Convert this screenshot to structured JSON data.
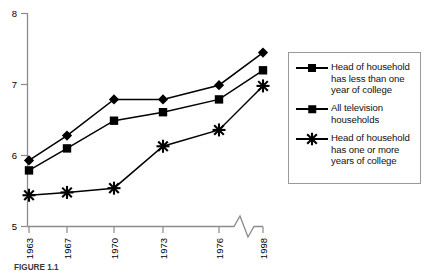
{
  "chart_data": {
    "type": "line",
    "title": "",
    "subtitle": "",
    "xlabel": "",
    "ylabel": "",
    "categories": [
      "1963",
      "1967",
      "1970",
      "1973",
      "1976",
      "1998"
    ],
    "x_tick_labels": [
      "1963",
      "1967",
      "1970",
      "1973",
      "1976",
      "1998"
    ],
    "y_tick_labels": [
      "5",
      "6",
      "7",
      "8"
    ],
    "ylim": [
      5,
      8
    ],
    "y_ticks": [
      5,
      6,
      7,
      8
    ],
    "grid": false,
    "axis_break": {
      "present": true,
      "between": [
        "1976",
        "1998"
      ],
      "style": "zigzag"
    },
    "legend_position": "right-outside",
    "series": [
      {
        "name": "Head of household has less than one year of college",
        "marker": "diamond",
        "values": [
          5.93,
          6.28,
          6.79,
          6.79,
          6.99,
          7.45
        ]
      },
      {
        "name": "All television households",
        "marker": "square",
        "values": [
          5.79,
          6.1,
          6.49,
          6.61,
          6.79,
          7.2
        ]
      },
      {
        "name": "Head of household has one or more years of college",
        "marker": "asterisk",
        "values": [
          5.44,
          5.48,
          5.54,
          6.13,
          6.36,
          6.98
        ]
      }
    ]
  },
  "legend": {
    "entries": [
      {
        "label": "Head of household\nhas less than one\nyear of college",
        "marker": "diamond-marker"
      },
      {
        "label": "All television\nhouseholds",
        "marker": "square-marker"
      },
      {
        "label": "Head of household\nhas one or more\nyears of college",
        "marker": "asterisk-marker"
      }
    ]
  },
  "axes": {
    "y_labels": [
      "8",
      "7",
      "6",
      "5"
    ],
    "x_labels": [
      "1963",
      "1967",
      "1970",
      "1973",
      "1976",
      "1998"
    ]
  },
  "caption": {
    "label": "FIGURE 1.1",
    "text": ""
  },
  "colors": {
    "line": "#000000",
    "marker": "#000000",
    "axis": "#8a8a8a",
    "legend_border": "#9a9a9a",
    "background": "#ffffff"
  }
}
